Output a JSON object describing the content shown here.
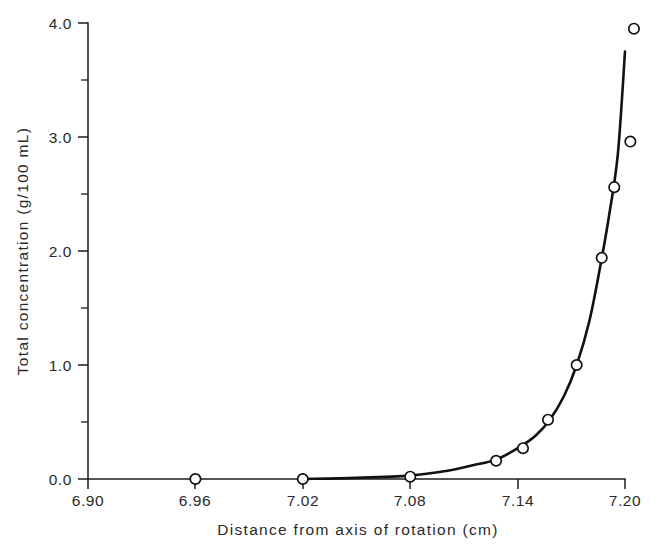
{
  "chart_data": {
    "type": "line",
    "title": "",
    "xlabel": "Distance from axis of rotation (cm)",
    "ylabel": "Total concentration (g/100 mL)",
    "xlim": [
      6.9,
      7.2
    ],
    "ylim": [
      0.0,
      4.0
    ],
    "grid": false,
    "legend": "none",
    "x_ticks": [
      6.9,
      6.96,
      7.02,
      7.08,
      7.14,
      7.2
    ],
    "x_tick_labels": [
      "6.90",
      "6.96",
      "7.02",
      "7.08",
      "7.14",
      "7.20"
    ],
    "x_minor_ticks": [
      6.93,
      6.99,
      7.05,
      7.11,
      7.17
    ],
    "y_ticks": [
      0.0,
      1.0,
      2.0,
      3.0,
      4.0
    ],
    "y_tick_labels": [
      "0.0",
      "1.0",
      "2.0",
      "3.0",
      "4.0"
    ],
    "y_minor_ticks": [
      0.5,
      1.5,
      2.5,
      3.5
    ],
    "marker_style": "open-circle",
    "series": [
      {
        "name": "Total concentration",
        "x": [
          6.96,
          7.02,
          7.08,
          7.128,
          7.143,
          7.157,
          7.173,
          7.187,
          7.194,
          7.203
        ],
        "y": [
          0.0,
          0.0,
          0.02,
          0.16,
          0.27,
          0.52,
          1.0,
          1.94,
          2.56,
          2.96
        ],
        "extra_points": [
          {
            "x": 7.205,
            "y": 3.95,
            "note": "topmost open circle above fitted curve"
          }
        ]
      }
    ],
    "fitted_curve": {
      "description": "smooth exponential sedimentation-equilibrium curve rising from baseline near 7.02 to about 3.75 at 7.20",
      "x": [
        7.02,
        7.05,
        7.08,
        7.1,
        7.115,
        7.128,
        7.14,
        7.15,
        7.158,
        7.166,
        7.173,
        7.18,
        7.186,
        7.191,
        7.196,
        7.2
      ],
      "y": [
        0.0,
        0.01,
        0.03,
        0.07,
        0.12,
        0.17,
        0.27,
        0.38,
        0.52,
        0.73,
        1.0,
        1.38,
        1.85,
        2.3,
        2.85,
        3.75
      ]
    }
  },
  "axis": {
    "y_title": "Total concentration (g/100 mL)",
    "x_title": "Distance from axis of rotation (cm)"
  }
}
